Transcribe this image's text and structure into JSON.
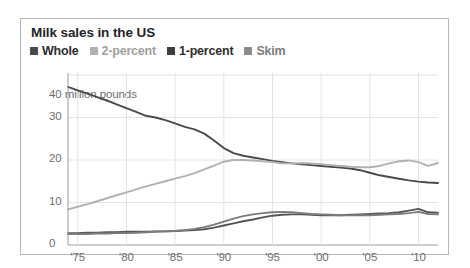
{
  "chart_data": {
    "type": "line",
    "title": "Milk sales in the US",
    "xlabel": "",
    "ylabel": "million pounds",
    "y_axis_caption": "40 million pounds",
    "ylim": [
      0,
      40
    ],
    "xlim": [
      1974,
      2012
    ],
    "grid": true,
    "grid_axis": "both",
    "legend_position": "top-left",
    "y_ticks": [
      {
        "value": 40,
        "label": "40"
      },
      {
        "value": 30,
        "label": "30"
      },
      {
        "value": 20,
        "label": "20"
      },
      {
        "value": 10,
        "label": "10"
      },
      {
        "value": 0,
        "label": "0"
      }
    ],
    "x_ticks": [
      {
        "value": 1975,
        "label": "'75"
      },
      {
        "value": 1980,
        "label": "'80"
      },
      {
        "value": 1985,
        "label": "'85"
      },
      {
        "value": 1990,
        "label": "'90"
      },
      {
        "value": 1995,
        "label": "'95"
      },
      {
        "value": 2000,
        "label": "'00"
      },
      {
        "value": 2005,
        "label": "'05"
      },
      {
        "value": 2010,
        "label": "'10"
      }
    ],
    "x": [
      1974,
      1975,
      1976,
      1977,
      1978,
      1979,
      1980,
      1981,
      1982,
      1983,
      1984,
      1985,
      1986,
      1987,
      1988,
      1989,
      1990,
      1991,
      1992,
      1993,
      1994,
      1995,
      1996,
      1997,
      1998,
      1999,
      2000,
      2001,
      2002,
      2003,
      2004,
      2005,
      2006,
      2007,
      2008,
      2009,
      2010,
      2011,
      2012
    ],
    "series": [
      {
        "name": "Whole",
        "color": "#4a4a4a",
        "values": [
          37.2,
          36.4,
          35.6,
          34.8,
          34.0,
          33.1,
          32.2,
          31.3,
          30.4,
          30.0,
          29.4,
          28.6,
          27.8,
          27.2,
          26.2,
          24.6,
          22.8,
          21.6,
          21.0,
          20.6,
          20.2,
          19.8,
          19.5,
          19.2,
          19.0,
          18.8,
          18.6,
          18.4,
          18.2,
          18.0,
          17.6,
          17.0,
          16.4,
          16.0,
          15.6,
          15.2,
          14.9,
          14.7,
          14.6
        ]
      },
      {
        "name": "2-percent",
        "color": "#b1b1b1",
        "values": [
          8.4,
          9.0,
          9.6,
          10.3,
          11.0,
          11.7,
          12.4,
          13.1,
          13.8,
          14.4,
          15.0,
          15.6,
          16.2,
          16.9,
          17.8,
          18.7,
          19.6,
          20.0,
          20.0,
          19.9,
          19.7,
          19.5,
          19.2,
          19.2,
          19.3,
          19.2,
          19.0,
          18.8,
          18.6,
          18.4,
          18.3,
          18.3,
          18.6,
          19.2,
          19.7,
          19.9,
          19.5,
          18.6,
          19.3
        ]
      },
      {
        "name": "1-percent",
        "color": "#555555",
        "values": [
          2.8,
          2.8,
          2.9,
          2.9,
          3.0,
          3.0,
          3.1,
          3.1,
          3.1,
          3.2,
          3.2,
          3.3,
          3.4,
          3.5,
          3.7,
          4.1,
          4.6,
          5.1,
          5.6,
          6.0,
          6.5,
          6.9,
          7.1,
          7.2,
          7.2,
          7.1,
          7.0,
          7.0,
          7.0,
          7.1,
          7.2,
          7.3,
          7.4,
          7.5,
          7.7,
          8.1,
          8.5,
          7.7,
          7.6
        ]
      },
      {
        "name": "Skim",
        "color": "#7b7b7b",
        "values": [
          2.6,
          2.6,
          2.6,
          2.7,
          2.7,
          2.8,
          2.8,
          2.9,
          3.0,
          3.1,
          3.2,
          3.3,
          3.5,
          3.8,
          4.2,
          4.8,
          5.5,
          6.2,
          6.8,
          7.2,
          7.5,
          7.7,
          7.8,
          7.7,
          7.5,
          7.3,
          7.2,
          7.1,
          7.0,
          7.0,
          7.0,
          7.0,
          7.1,
          7.2,
          7.3,
          7.5,
          7.8,
          7.3,
          7.2
        ]
      }
    ]
  },
  "legend": {
    "items": [
      {
        "label": "Whole",
        "color": "#4a4a4a",
        "text_color": "#2e2e2e"
      },
      {
        "label": "2-percent",
        "color": "#b1b1b1",
        "text_color": "#a0a0a0"
      },
      {
        "label": "1-percent",
        "color": "#3d3d3d",
        "text_color": "#2e2e2e"
      },
      {
        "label": "Skim",
        "color": "#8a8a8a",
        "text_color": "#7d7d7d"
      }
    ]
  },
  "style": {
    "grid_color": "#e3e3e3",
    "axis_color": "#9b9b9b",
    "border_color": "#b6b6b6",
    "background": "#ffffff",
    "tick_text_color": "#6d6d6d"
  }
}
